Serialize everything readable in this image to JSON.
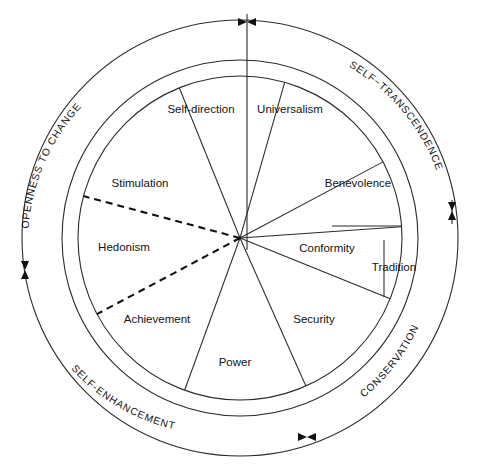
{
  "diagram": {
    "type": "circumplex-wheel",
    "center": {
      "x": 240,
      "y": 238
    },
    "radii": {
      "inner_circle": 162,
      "ring_inner": 178,
      "ring_outer": 218
    },
    "background_color": "#ffffff",
    "line_color": "#2b2b2b",
    "text_color": "#131313"
  },
  "values": [
    {
      "id": "self-direction",
      "label": "Self-direction",
      "start_angle": -112,
      "end_angle": -74,
      "label_x": 201,
      "label_y": 110,
      "higher_order": "openness-to-change"
    },
    {
      "id": "universalism",
      "label": "Universalism",
      "start_angle": -74,
      "end_angle": -28,
      "label_x": 290,
      "label_y": 110,
      "higher_order": "self-transcendence"
    },
    {
      "id": "benevolence",
      "label": "Benevolence",
      "start_angle": -28,
      "end_angle": -4,
      "label_x": 358,
      "label_y": 184,
      "higher_order": "self-transcendence"
    },
    {
      "id": "conformity",
      "label": "Conformity",
      "start_angle": -4,
      "end_angle": 22,
      "label_x": 327,
      "label_y": 249,
      "higher_order": "conservation"
    },
    {
      "id": "tradition",
      "label": "Tradition",
      "start_angle": -4,
      "end_angle": 22,
      "label_x": 394,
      "label_y": 268,
      "higher_order": "conservation"
    },
    {
      "id": "security",
      "label": "Security",
      "start_angle": 22,
      "end_angle": 66,
      "label_x": 314,
      "label_y": 320,
      "higher_order": "conservation"
    },
    {
      "id": "power",
      "label": "Power",
      "start_angle": 66,
      "end_angle": 110,
      "label_x": 235,
      "label_y": 363,
      "higher_order": "self-enhancement"
    },
    {
      "id": "achievement",
      "label": "Achievement",
      "start_angle": 110,
      "end_angle": 152,
      "label_x": 157,
      "label_y": 320,
      "higher_order": "self-enhancement"
    },
    {
      "id": "hedonism",
      "label": "Hedonism",
      "start_angle": 152,
      "end_angle": 195,
      "label_x": 124,
      "label_y": 248,
      "higher_order": "self-enhancement"
    },
    {
      "id": "stimulation",
      "label": "Stimulation",
      "start_angle": 195,
      "end_angle": 248,
      "label_x": 140,
      "label_y": 184,
      "higher_order": "openness-to-change"
    }
  ],
  "higher_order_labels": [
    {
      "id": "openness-to-change",
      "label": "OPENNESS TO CHANGE"
    },
    {
      "id": "self-transcendence",
      "label": "SELF−TRANSCENDENCE"
    },
    {
      "id": "conservation",
      "label": "CONSERVATION"
    },
    {
      "id": "self-enhancement",
      "label": "SELF-ENHANCEMENT"
    }
  ],
  "ring_arrow_markers": [
    {
      "id": "top",
      "x": 247,
      "y": 22
    },
    {
      "id": "right",
      "x": 452,
      "y": 211
    },
    {
      "id": "bottom",
      "x": 307,
      "y": 437
    },
    {
      "id": "left",
      "x": 25,
      "y": 270
    }
  ],
  "dashed_boundaries": [
    {
      "id": "hedonism-stimulation-boundary",
      "angle": 195
    },
    {
      "id": "hedonism-achievement-boundary",
      "angle": 152
    }
  ]
}
